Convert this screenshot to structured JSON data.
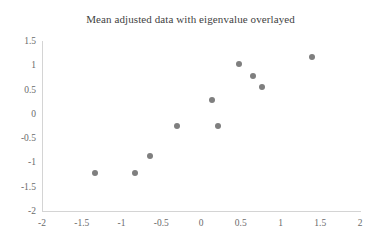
{
  "chart_data": {
    "type": "scatter",
    "title": "Mean adjusted data with eigenvalue overlayed",
    "xlabel": "",
    "ylabel": "",
    "xlim": [
      -2,
      2
    ],
    "ylim": [
      -2,
      1.5
    ],
    "grid": false,
    "legend": "none",
    "marker_color": "#7f7f7f",
    "axis_color": "#d4d4d4",
    "tick_color": "#6b6b6b",
    "title_color": "#3f3f3f",
    "xticks": [
      -2,
      -1.5,
      -1,
      -0.5,
      0,
      0.5,
      1,
      1.5,
      2
    ],
    "xtick_labels": [
      "-2",
      "-1.5",
      "-1",
      "-0.5",
      "0",
      "0.5",
      "1",
      "1.5",
      "2"
    ],
    "yticks": [
      1.5,
      1,
      0.5,
      0,
      -0.5,
      -1,
      -1.5,
      -2
    ],
    "ytick_labels": [
      "1.5",
      "1",
      "0.5",
      "0",
      "-0.5",
      "-1",
      "-1.5",
      "-2"
    ],
    "points": [
      {
        "x": -1.33,
        "y": -1.22
      },
      {
        "x": -0.83,
        "y": -1.22
      },
      {
        "x": -0.64,
        "y": -0.87
      },
      {
        "x": -0.3,
        "y": -0.26
      },
      {
        "x": 0.21,
        "y": -0.26
      },
      {
        "x": 0.14,
        "y": 0.28
      },
      {
        "x": 0.48,
        "y": 1.03
      },
      {
        "x": 0.66,
        "y": 0.78
      },
      {
        "x": 0.77,
        "y": 0.56
      },
      {
        "x": 1.4,
        "y": 1.17
      }
    ]
  }
}
